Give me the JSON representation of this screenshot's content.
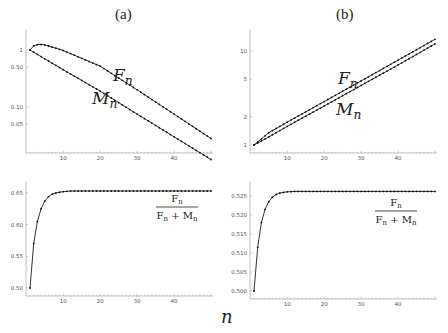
{
  "panels": {
    "a_title": "(a)",
    "b_title": "(b)"
  },
  "x_axis_label": "n",
  "labels": {
    "F": "F",
    "M": "M",
    "sub": "n",
    "ratio_num": "F",
    "ratio_den_a": "F",
    "ratio_plus": "+",
    "ratio_den_b": "M"
  },
  "chart_data": [
    {
      "id": "top-left",
      "panel": "(a)",
      "type": "line",
      "yscale": "log",
      "xlabel": "n",
      "ylabel": "",
      "xlim": [
        1,
        50
      ],
      "ylim": [
        0.01,
        1.5
      ],
      "xticks": [
        "10",
        "20",
        "30",
        "40"
      ],
      "yticks": [
        "1",
        "0.50",
        "0.10",
        "0.05"
      ],
      "series": [
        {
          "name": "F_n",
          "points": [
            [
              1,
              1.0
            ],
            [
              2,
              1.18
            ],
            [
              3,
              1.24
            ],
            [
              4,
              1.25
            ],
            [
              5,
              1.23
            ],
            [
              10,
              0.98
            ],
            [
              20,
              0.52
            ],
            [
              30,
              0.2
            ],
            [
              40,
              0.075
            ],
            [
              50,
              0.028
            ]
          ]
        },
        {
          "name": "M_n",
          "points": [
            [
              1,
              1.0
            ],
            [
              10,
              0.45
            ],
            [
              20,
              0.19
            ],
            [
              30,
              0.075
            ],
            [
              40,
              0.03
            ],
            [
              50,
              0.012
            ]
          ]
        }
      ],
      "annotations": [
        "F_n",
        "M_n"
      ],
      "grid": false
    },
    {
      "id": "top-right",
      "panel": "(b)",
      "type": "line",
      "yscale": "log",
      "xlabel": "n",
      "xlim": [
        1,
        50
      ],
      "ylim": [
        0.9,
        15
      ],
      "xticks": [
        "10",
        "20",
        "30",
        "40"
      ],
      "yticks": [
        "1",
        "2",
        "5",
        "10"
      ],
      "series": [
        {
          "name": "F_n",
          "points": [
            [
              1,
              1.0
            ],
            [
              5,
              1.35
            ],
            [
              10,
              1.75
            ],
            [
              20,
              2.9
            ],
            [
              30,
              4.8
            ],
            [
              40,
              8.0
            ],
            [
              50,
              13.3
            ]
          ]
        },
        {
          "name": "M_n",
          "points": [
            [
              1,
              1.0
            ],
            [
              5,
              1.22
            ],
            [
              10,
              1.58
            ],
            [
              20,
              2.6
            ],
            [
              30,
              4.3
            ],
            [
              40,
              7.1
            ],
            [
              50,
              11.9
            ]
          ]
        }
      ],
      "annotations": [
        "F_n",
        "M_n"
      ],
      "grid": false
    },
    {
      "id": "bottom-left",
      "panel": "(a)",
      "type": "line",
      "xlabel": "n",
      "xlim": [
        1,
        50
      ],
      "ylim": [
        0.49,
        0.66
      ],
      "xticks": [
        "10",
        "20",
        "30",
        "40"
      ],
      "yticks": [
        "0.65",
        "0.60",
        "0.55",
        "0.50"
      ],
      "series": [
        {
          "name": "F_n/(F_n+M_n)",
          "points": [
            [
              1,
              0.5
            ],
            [
              2,
              0.57
            ],
            [
              3,
              0.605
            ],
            [
              4,
              0.625
            ],
            [
              5,
              0.637
            ],
            [
              6,
              0.644
            ],
            [
              7,
              0.648
            ],
            [
              8,
              0.65
            ],
            [
              10,
              0.652
            ],
            [
              12,
              0.653
            ],
            [
              20,
              0.653
            ],
            [
              30,
              0.653
            ],
            [
              40,
              0.653
            ],
            [
              50,
              0.653
            ]
          ]
        }
      ],
      "annotations": [
        "F_n / (F_n + M_n)"
      ],
      "grid": false
    },
    {
      "id": "bottom-right",
      "panel": "(b)",
      "type": "line",
      "xlabel": "n",
      "xlim": [
        1,
        50
      ],
      "ylim": [
        0.499,
        0.527
      ],
      "xticks": [
        "10",
        "20",
        "30",
        "40"
      ],
      "yticks": [
        "0.525",
        "0.520",
        "0.515",
        "0.510",
        "0.505",
        "0.500"
      ],
      "series": [
        {
          "name": "F_n/(F_n+M_n)",
          "points": [
            [
              1,
              0.5
            ],
            [
              2,
              0.5115
            ],
            [
              3,
              0.518
            ],
            [
              4,
              0.5215
            ],
            [
              5,
              0.5235
            ],
            [
              6,
              0.5247
            ],
            [
              7,
              0.5254
            ],
            [
              8,
              0.5258
            ],
            [
              10,
              0.5261
            ],
            [
              12,
              0.5262
            ],
            [
              20,
              0.5262
            ],
            [
              30,
              0.5262
            ],
            [
              40,
              0.5262
            ],
            [
              50,
              0.5262
            ]
          ]
        }
      ],
      "annotations": [
        "F_n / (F_n + M_n)"
      ],
      "grid": false
    }
  ]
}
